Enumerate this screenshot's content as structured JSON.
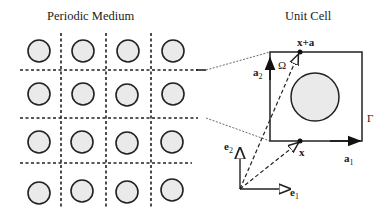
{
  "titles": {
    "left": "Periodic Medium",
    "right": "Unit Cell"
  },
  "labels": {
    "x_plus_a": "x+a",
    "x": "x",
    "omega": "Ω",
    "gamma": "Γ",
    "a1": "a",
    "a1_sub": "1",
    "a2": "a",
    "a2_sub": "2",
    "e1": "e",
    "e1_sub": "1",
    "e2": "e",
    "e2_sub": "2"
  },
  "colors": {
    "stroke": "#222222",
    "inclusion_fill": "#eaeaea"
  },
  "grid": {
    "rows": 4,
    "cols": 4
  }
}
